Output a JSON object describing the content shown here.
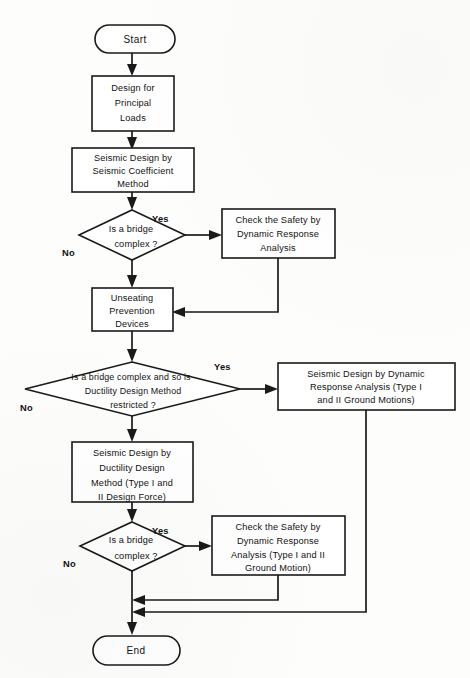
{
  "diagram": {
    "type": "flowchart",
    "title_visible": false,
    "terminators": {
      "start": "Start",
      "end": "End"
    },
    "edge_labels": {
      "yes": "Yes",
      "no": "No"
    },
    "nodes": [
      {
        "id": "start",
        "shape": "terminator",
        "label": "Start"
      },
      {
        "id": "design_principal",
        "shape": "process",
        "lines": [
          "Design for",
          "Principal",
          "Loads"
        ]
      },
      {
        "id": "seismic_coefficient",
        "shape": "process",
        "lines": [
          "Seismic Design by",
          "Seismic Coefficient",
          "Method"
        ]
      },
      {
        "id": "decision_complex_1",
        "shape": "decision",
        "lines": [
          "Is a bridge",
          "complex ?"
        ]
      },
      {
        "id": "check_safety_1",
        "shape": "process",
        "lines": [
          "Check the Safety by",
          "Dynamic Response",
          "Analysis"
        ]
      },
      {
        "id": "unseating",
        "shape": "process",
        "lines": [
          "Unseating",
          "Prevention",
          "Devices"
        ]
      },
      {
        "id": "decision_ductility_restricted",
        "shape": "decision",
        "lines": [
          "Is a bridge complex and so is",
          "Ductility  Design Method",
          "restricted ?"
        ]
      },
      {
        "id": "seismic_dynamic_response",
        "shape": "process",
        "lines": [
          "Seismic Design by Dynamic",
          "Response Analysis (Type I",
          "and II Ground Motions)"
        ]
      },
      {
        "id": "seismic_ductility",
        "shape": "process",
        "lines": [
          "Seismic Design by",
          "Ductility  Design",
          "Method (Type I and",
          "II Design Force)"
        ]
      },
      {
        "id": "decision_complex_2",
        "shape": "decision",
        "lines": [
          "Is a bridge",
          "complex ?"
        ]
      },
      {
        "id": "check_safety_2",
        "shape": "process",
        "lines": [
          "Check the Safety by",
          "Dynamic Response",
          "Analysis (Type I and II",
          "Ground Motion)"
        ]
      },
      {
        "id": "end",
        "shape": "terminator",
        "label": "End"
      }
    ],
    "edges": [
      {
        "from": "start",
        "to": "design_principal",
        "label": ""
      },
      {
        "from": "design_principal",
        "to": "seismic_coefficient",
        "label": ""
      },
      {
        "from": "seismic_coefficient",
        "to": "decision_complex_1",
        "label": ""
      },
      {
        "from": "decision_complex_1",
        "to": "check_safety_1",
        "label": "Yes"
      },
      {
        "from": "decision_complex_1",
        "to": "unseating",
        "label": "No"
      },
      {
        "from": "check_safety_1",
        "to": "unseating",
        "label": ""
      },
      {
        "from": "unseating",
        "to": "decision_ductility_restricted",
        "label": ""
      },
      {
        "from": "decision_ductility_restricted",
        "to": "seismic_dynamic_response",
        "label": "Yes"
      },
      {
        "from": "decision_ductility_restricted",
        "to": "seismic_ductility",
        "label": "No"
      },
      {
        "from": "seismic_ductility",
        "to": "decision_complex_2",
        "label": ""
      },
      {
        "from": "decision_complex_2",
        "to": "check_safety_2",
        "label": "Yes"
      },
      {
        "from": "decision_complex_2",
        "to": "end",
        "label": "No"
      },
      {
        "from": "check_safety_2",
        "to": "end",
        "label": ""
      },
      {
        "from": "seismic_dynamic_response",
        "to": "end",
        "label": ""
      }
    ],
    "colors": {
      "stroke": "#1a1a1a",
      "fill": "#ffffff",
      "background": "#fdfdfc",
      "text": "#111111"
    }
  }
}
